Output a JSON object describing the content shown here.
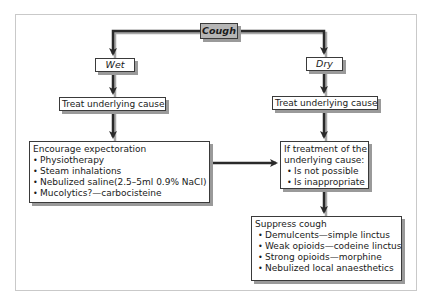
{
  "diagram": {
    "title": "Cough",
    "branches": {
      "wet": {
        "label": "Wet",
        "step1": "Treat underlying cause",
        "management": {
          "heading": "Encourage expectoration",
          "items": [
            "Physiotherapy",
            "Steam inhalations",
            "Nebulized saline(2.5–5ml 0.9% NaCl)",
            "Mucolytics?—carbocisteine"
          ]
        }
      },
      "dry": {
        "label": "Dry",
        "step1": "Treat underlying cause",
        "condition": {
          "heading_line1": "If treatment of the",
          "heading_line2": "underlying cause:",
          "items": [
            "Is not possible",
            "Is inappropriate"
          ]
        },
        "suppress": {
          "heading": "Suppress cough",
          "items": [
            "Demulcents—simple linctus",
            "Weak opioids—codeine linctus",
            "Strong opioids—morphine",
            "Nebulized local anaesthetics"
          ]
        }
      }
    },
    "bullet_symbol": "•",
    "colors": {
      "line": "#2a2a2a",
      "shadow": "#9a9a9a",
      "root_fill": "#b5b5b5",
      "frame": "#c9c9c9"
    }
  }
}
